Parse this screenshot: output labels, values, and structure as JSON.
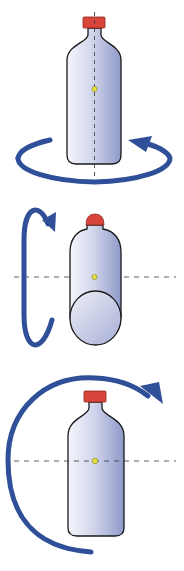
{
  "figure": {
    "panels": [
      {
        "id": "vertical-axis-rotation",
        "axis": "vertical",
        "arrow_direction": "counterclockwise-horizontal"
      },
      {
        "id": "longitudinal-horizontal-axis-rotation",
        "axis": "horizontal",
        "arrow_direction": "vertical-loop"
      },
      {
        "id": "transverse-horizontal-axis-rotation",
        "axis": "horizontal",
        "arrow_direction": "clockwise"
      }
    ]
  },
  "colors": {
    "arrow": "#2f4f98",
    "cap": "#d9453a",
    "cap_stroke": "#8a2a22",
    "bottle_light": "#f2f3fa",
    "bottle_dark": "#9aa3cf",
    "outline": "#1a1a1a",
    "center_dot": "#e8e040",
    "axis": "#333333"
  }
}
